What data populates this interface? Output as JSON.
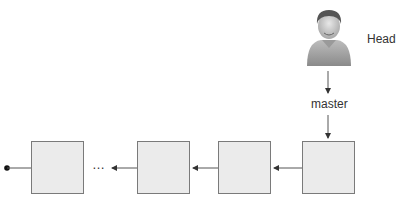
{
  "diagram": {
    "head": {
      "label": "Head",
      "icon": "user-avatar-icon"
    },
    "branch": {
      "label": "master"
    },
    "ellipsis": "…",
    "commits": [
      {
        "id": "commit-1",
        "x": 31
      },
      {
        "id": "commit-2",
        "x": 137
      },
      {
        "id": "commit-3",
        "x": 218
      },
      {
        "id": "commit-4",
        "x": 302
      }
    ],
    "colors": {
      "box_fill": "#ebebeb",
      "box_border": "#7a7a7a",
      "line": "#555555"
    }
  }
}
